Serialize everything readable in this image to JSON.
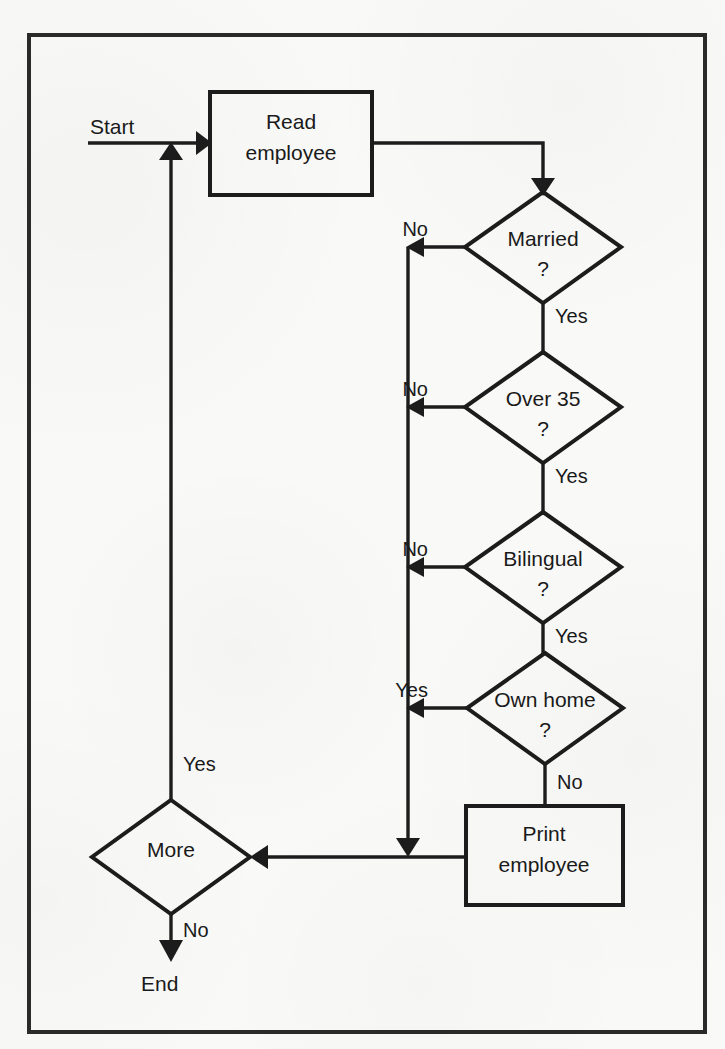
{
  "diagram": {
    "type": "flowchart",
    "colors": {
      "background": "#f9f9f8",
      "stroke": "#1c1c1c",
      "text": "#1a1a1a",
      "frame": "#2a2a2a"
    },
    "terminals": {
      "start": "Start",
      "end": "End"
    },
    "processes": [
      {
        "id": "read",
        "label_line1": "Read",
        "label_line2": "employee"
      },
      {
        "id": "print",
        "label_line1": "Print",
        "label_line2": "employee"
      }
    ],
    "decisions": [
      {
        "id": "married",
        "label_line1": "Married",
        "label_line2": "?",
        "left_branch": "No",
        "bottom_branch": "Yes"
      },
      {
        "id": "over35",
        "label_line1": "Over 35",
        "label_line2": "?",
        "left_branch": "No",
        "bottom_branch": "Yes"
      },
      {
        "id": "bilingual",
        "label_line1": "Bilingual",
        "label_line2": "?",
        "left_branch": "No",
        "bottom_branch": "Yes"
      },
      {
        "id": "ownhome",
        "label_line1": "Own home",
        "label_line2": "?",
        "left_branch": "Yes",
        "bottom_branch": "No"
      },
      {
        "id": "more",
        "label_line1": "More",
        "label_line2": "",
        "top_branch": "Yes",
        "bottom_branch": "No"
      }
    ],
    "edge_labels": {
      "married_no": "No",
      "married_yes": "Yes",
      "over35_no": "No",
      "over35_yes": "Yes",
      "bilingual_no": "No",
      "bilingual_yes": "Yes",
      "ownhome_yes": "Yes",
      "ownhome_no": "No",
      "more_yes": "Yes",
      "more_no": "No"
    }
  }
}
